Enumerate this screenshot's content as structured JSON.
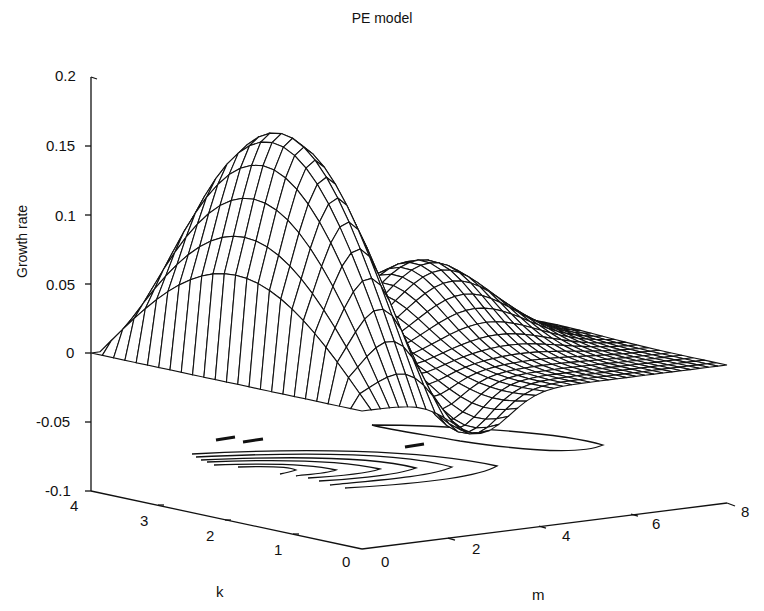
{
  "chart_data": {
    "type": "surface3d",
    "title": "PE model",
    "xlabel": "m",
    "ylabel": "k",
    "zlabel": "Growth rate",
    "xlim": [
      0,
      8
    ],
    "ylim": [
      0,
      4
    ],
    "zlim": [
      -0.1,
      0.2
    ],
    "x_ticks": [
      "0",
      "2",
      "4",
      "6",
      "8"
    ],
    "y_ticks": [
      "0",
      "1",
      "2",
      "3",
      "4"
    ],
    "z_ticks": [
      "0.2",
      "0.15",
      "0.1",
      "0.05",
      "0",
      "-0.05",
      "-0.1"
    ],
    "grid": false,
    "legend": null,
    "features": {
      "main_peak": {
        "m": 1.0,
        "k": 2.0,
        "growth_rate": 0.17
      },
      "secondary_peak": {
        "m": 5.0,
        "k": 2.5,
        "growth_rate": 0.06
      },
      "min_trough": {
        "growth_rate": -0.035
      },
      "contour_projection": "contours of the surface projected on the base plane at z = -0.1"
    },
    "approx_samples": [
      {
        "m": 0.0,
        "k": 2.0,
        "z": 0.0
      },
      {
        "m": 0.5,
        "k": 2.0,
        "z": 0.12
      },
      {
        "m": 1.0,
        "k": 2.0,
        "z": 0.17
      },
      {
        "m": 2.0,
        "k": 2.0,
        "z": 0.13
      },
      {
        "m": 3.0,
        "k": 2.0,
        "z": 0.06
      },
      {
        "m": 4.0,
        "k": 2.0,
        "z": 0.01
      },
      {
        "m": 5.0,
        "k": 2.5,
        "z": 0.06
      },
      {
        "m": 6.0,
        "k": 2.5,
        "z": 0.04
      },
      {
        "m": 8.0,
        "k": 2.5,
        "z": 0.0
      },
      {
        "m": 2.5,
        "k": 0.5,
        "z": -0.035
      }
    ]
  }
}
